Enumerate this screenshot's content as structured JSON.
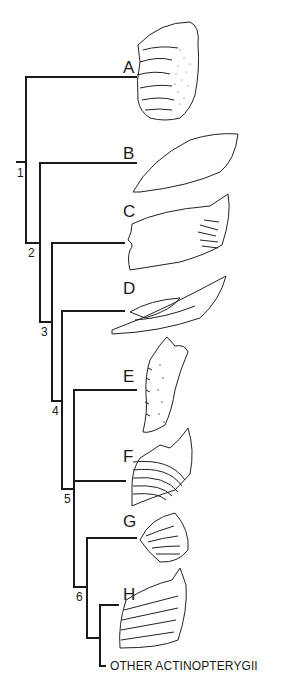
{
  "diagram": {
    "type": "cladogram",
    "colors": {
      "line": "#1a1a1a",
      "background": "#ffffff"
    },
    "taxa": [
      {
        "label": "A",
        "illustration": "dentigerous-bone-with-teeth-stippled"
      },
      {
        "label": "B",
        "illustration": "elongate-lens-shaped-bone"
      },
      {
        "label": "C",
        "illustration": "rectangular-bone-with-striations"
      },
      {
        "label": "D",
        "illustration": "tapered-bone-with-inner-plate"
      },
      {
        "label": "E",
        "illustration": "narrow-toothed-bone-stippled"
      },
      {
        "label": "F",
        "illustration": "toothplate-with-curved-rows"
      },
      {
        "label": "G",
        "illustration": "rounded-ribbed-bone"
      },
      {
        "label": "H",
        "illustration": "toothplate-with-oblique-ridges"
      }
    ],
    "outgroup_label": "OTHER ACTINOPTERYGII",
    "nodes": [
      "1",
      "2",
      "3",
      "4",
      "5",
      "6"
    ]
  }
}
